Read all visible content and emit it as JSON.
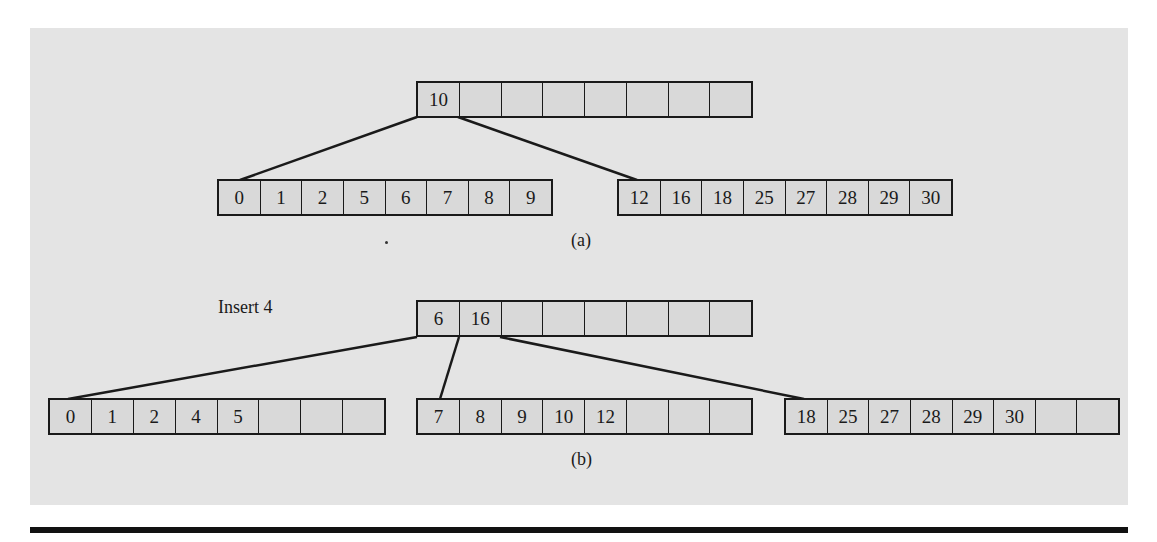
{
  "figure": {
    "part_a": {
      "caption": "(a)",
      "root": [
        "10",
        "",
        "",
        "",
        "",
        "",
        "",
        ""
      ],
      "leaves": [
        [
          "0",
          "1",
          "2",
          "5",
          "6",
          "7",
          "8",
          "9"
        ],
        [
          "12",
          "16",
          "18",
          "25",
          "27",
          "28",
          "29",
          "30"
        ]
      ]
    },
    "part_b": {
      "caption": "(b)",
      "annotation": "Insert 4",
      "root": [
        "6",
        "16",
        "",
        "",
        "",
        "",
        "",
        ""
      ],
      "leaves": [
        [
          "0",
          "1",
          "2",
          "4",
          "5",
          "",
          "",
          ""
        ],
        [
          "7",
          "8",
          "9",
          "10",
          "12",
          "",
          "",
          ""
        ],
        [
          "18",
          "25",
          "27",
          "28",
          "29",
          "30",
          "",
          ""
        ]
      ]
    }
  },
  "colors": {
    "panel": "#e4e4e4",
    "cell": "#d9d9d9",
    "stroke": "#1a1a1a"
  }
}
